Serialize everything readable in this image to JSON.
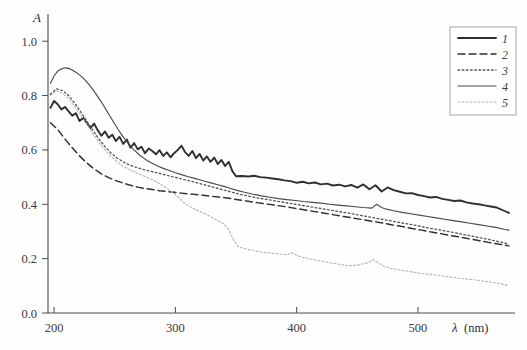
{
  "chart_data": {
    "type": "line",
    "title": "",
    "xlabel": "λ (nm)",
    "xlabel_symbol": "λ",
    "xlabel_unit": "(nm)",
    "ylabel": "A",
    "xlim": [
      195,
      580
    ],
    "ylim": [
      0.0,
      1.1
    ],
    "xticks": [
      200,
      300,
      400,
      500
    ],
    "xtick_labels": [
      "200",
      "300",
      "400",
      "500"
    ],
    "yticks": [
      0.0,
      0.2,
      0.4,
      0.6,
      0.8,
      1.0
    ],
    "ytick_labels": [
      "0.0",
      "0.2",
      "0.4",
      "0.6",
      "0.8",
      "1.0"
    ],
    "grid": false,
    "legend_position": "top-right",
    "legend_entries": [
      "1",
      "2",
      "3",
      "4",
      "5"
    ],
    "series": [
      {
        "name": "1",
        "label": "1",
        "style": "solid-thick",
        "color": "#2f2f2f",
        "width": 1.9,
        "dash": "",
        "x": [
          197,
          200,
          203,
          206,
          209,
          212,
          215,
          218,
          221,
          224,
          227,
          230,
          233,
          236,
          239,
          242,
          245,
          248,
          251,
          254,
          257,
          260,
          263,
          266,
          269,
          272,
          275,
          278,
          281,
          284,
          287,
          290,
          293,
          296,
          299,
          302,
          305,
          308,
          311,
          314,
          317,
          320,
          323,
          326,
          329,
          332,
          335,
          338,
          341,
          344,
          347,
          350,
          355,
          360,
          365,
          370,
          375,
          380,
          385,
          390,
          395,
          400,
          405,
          410,
          415,
          420,
          425,
          430,
          435,
          440,
          445,
          450,
          455,
          460,
          465,
          470,
          475,
          480,
          485,
          490,
          495,
          500,
          505,
          510,
          515,
          520,
          525,
          530,
          535,
          540,
          545,
          550,
          555,
          560,
          565,
          570,
          575
        ],
        "y": [
          0.755,
          0.78,
          0.768,
          0.749,
          0.758,
          0.742,
          0.726,
          0.735,
          0.706,
          0.718,
          0.698,
          0.681,
          0.697,
          0.672,
          0.652,
          0.668,
          0.645,
          0.656,
          0.633,
          0.648,
          0.622,
          0.638,
          0.608,
          0.625,
          0.602,
          0.612,
          0.588,
          0.605,
          0.596,
          0.584,
          0.599,
          0.578,
          0.591,
          0.573,
          0.588,
          0.6,
          0.615,
          0.592,
          0.578,
          0.596,
          0.57,
          0.585,
          0.561,
          0.576,
          0.556,
          0.572,
          0.548,
          0.563,
          0.541,
          0.556,
          0.522,
          0.503,
          0.504,
          0.502,
          0.505,
          0.5,
          0.498,
          0.495,
          0.492,
          0.488,
          0.485,
          0.479,
          0.483,
          0.477,
          0.48,
          0.473,
          0.476,
          0.469,
          0.472,
          0.466,
          0.471,
          0.461,
          0.473,
          0.455,
          0.47,
          0.447,
          0.462,
          0.452,
          0.446,
          0.44,
          0.441,
          0.434,
          0.43,
          0.425,
          0.427,
          0.42,
          0.416,
          0.412,
          0.414,
          0.407,
          0.403,
          0.4,
          0.396,
          0.392,
          0.388,
          0.378,
          0.368
        ]
      },
      {
        "name": "2",
        "label": "2",
        "style": "dashed",
        "color": "#2f2f2f",
        "width": 1.45,
        "dash": "7,4",
        "x": [
          197,
          203,
          209,
          215,
          221,
          227,
          233,
          239,
          245,
          251,
          257,
          263,
          269,
          275,
          281,
          287,
          293,
          299,
          305,
          311,
          317,
          323,
          329,
          335,
          341,
          347,
          353,
          360,
          367,
          375,
          383,
          391,
          399,
          407,
          415,
          423,
          431,
          439,
          447,
          455,
          463,
          471,
          479,
          487,
          495,
          503,
          511,
          519,
          527,
          535,
          543,
          551,
          559,
          567,
          575
        ],
        "y": [
          0.7,
          0.675,
          0.64,
          0.608,
          0.578,
          0.552,
          0.53,
          0.512,
          0.498,
          0.487,
          0.478,
          0.47,
          0.463,
          0.458,
          0.454,
          0.45,
          0.447,
          0.444,
          0.441,
          0.438,
          0.436,
          0.433,
          0.43,
          0.427,
          0.424,
          0.42,
          0.416,
          0.411,
          0.406,
          0.401,
          0.396,
          0.391,
          0.385,
          0.379,
          0.373,
          0.367,
          0.361,
          0.355,
          0.349,
          0.343,
          0.337,
          0.331,
          0.324,
          0.318,
          0.311,
          0.305,
          0.298,
          0.292,
          0.285,
          0.279,
          0.272,
          0.266,
          0.259,
          0.253,
          0.247
        ]
      },
      {
        "name": "3",
        "label": "3",
        "style": "dotted",
        "color": "#555555",
        "width": 1.35,
        "dash": "1.6,2.6",
        "x": [
          197,
          202,
          207,
          212,
          217,
          222,
          227,
          232,
          237,
          242,
          247,
          252,
          257,
          262,
          267,
          272,
          277,
          282,
          287,
          292,
          297,
          302,
          307,
          312,
          317,
          322,
          327,
          332,
          337,
          342,
          347,
          353,
          360,
          367,
          375,
          383,
          391,
          399,
          407,
          415,
          423,
          431,
          439,
          447,
          455,
          463,
          471,
          479,
          487,
          495,
          503,
          511,
          519,
          527,
          535,
          543,
          551,
          559,
          567,
          575
        ],
        "y": [
          0.805,
          0.825,
          0.818,
          0.8,
          0.772,
          0.74,
          0.706,
          0.672,
          0.64,
          0.612,
          0.588,
          0.57,
          0.556,
          0.545,
          0.537,
          0.53,
          0.524,
          0.519,
          0.514,
          0.508,
          0.502,
          0.497,
          0.491,
          0.486,
          0.48,
          0.474,
          0.468,
          0.462,
          0.456,
          0.45,
          0.444,
          0.437,
          0.43,
          0.424,
          0.418,
          0.412,
          0.406,
          0.4,
          0.394,
          0.388,
          0.382,
          0.376,
          0.37,
          0.364,
          0.357,
          0.351,
          0.344,
          0.338,
          0.331,
          0.325,
          0.318,
          0.311,
          0.305,
          0.298,
          0.291,
          0.284,
          0.277,
          0.27,
          0.262,
          0.254
        ]
      },
      {
        "name": "4",
        "label": "4",
        "style": "solid-thin",
        "color": "#4a4a4a",
        "width": 1.15,
        "dash": "",
        "x": [
          197,
          200,
          203,
          206,
          209,
          212,
          215,
          218,
          221,
          224,
          227,
          230,
          233,
          236,
          239,
          242,
          245,
          248,
          251,
          254,
          257,
          260,
          265,
          270,
          275,
          280,
          285,
          290,
          295,
          300,
          305,
          310,
          315,
          320,
          325,
          330,
          335,
          340,
          345,
          350,
          357,
          364,
          371,
          378,
          385,
          392,
          399,
          406,
          413,
          420,
          427,
          434,
          441,
          448,
          455,
          462,
          466,
          470,
          474,
          480,
          487,
          494,
          501,
          508,
          515,
          522,
          529,
          536,
          543,
          550,
          557,
          564,
          571,
          575
        ],
        "y": [
          0.845,
          0.872,
          0.89,
          0.898,
          0.902,
          0.9,
          0.894,
          0.886,
          0.876,
          0.864,
          0.85,
          0.834,
          0.816,
          0.796,
          0.776,
          0.754,
          0.732,
          0.71,
          0.688,
          0.667,
          0.648,
          0.63,
          0.604,
          0.583,
          0.566,
          0.553,
          0.542,
          0.532,
          0.524,
          0.516,
          0.509,
          0.502,
          0.496,
          0.49,
          0.484,
          0.478,
          0.472,
          0.466,
          0.459,
          0.452,
          0.444,
          0.437,
          0.431,
          0.426,
          0.421,
          0.417,
          0.414,
          0.41,
          0.407,
          0.404,
          0.4,
          0.397,
          0.394,
          0.391,
          0.388,
          0.386,
          0.4,
          0.388,
          0.382,
          0.376,
          0.37,
          0.365,
          0.36,
          0.355,
          0.35,
          0.345,
          0.34,
          0.335,
          0.33,
          0.325,
          0.32,
          0.315,
          0.308,
          0.305
        ]
      },
      {
        "name": "5",
        "label": "5",
        "style": "dotted-light",
        "color": "#b4b4b4",
        "width": 1.1,
        "dash": "2,2",
        "x": [
          197,
          202,
          207,
          212,
          217,
          222,
          227,
          232,
          237,
          242,
          247,
          252,
          257,
          262,
          267,
          272,
          277,
          282,
          287,
          292,
          297,
          300,
          303,
          306,
          309,
          312,
          315,
          318,
          321,
          325,
          330,
          335,
          340,
          344,
          348,
          352,
          356,
          362,
          368,
          374,
          380,
          386,
          392,
          396,
          400,
          404,
          410,
          418,
          426,
          434,
          442,
          450,
          458,
          463,
          468,
          472,
          478,
          486,
          494,
          502,
          510,
          518,
          526,
          534,
          542,
          550,
          558,
          566,
          575
        ],
        "y": [
          0.8,
          0.818,
          0.808,
          0.788,
          0.76,
          0.728,
          0.694,
          0.66,
          0.628,
          0.6,
          0.576,
          0.556,
          0.54,
          0.528,
          0.518,
          0.508,
          0.498,
          0.488,
          0.476,
          0.462,
          0.446,
          0.436,
          0.424,
          0.41,
          0.4,
          0.392,
          0.384,
          0.378,
          0.372,
          0.364,
          0.352,
          0.34,
          0.328,
          0.306,
          0.268,
          0.244,
          0.238,
          0.232,
          0.226,
          0.222,
          0.22,
          0.217,
          0.214,
          0.222,
          0.212,
          0.206,
          0.2,
          0.192,
          0.186,
          0.18,
          0.174,
          0.176,
          0.184,
          0.196,
          0.182,
          0.172,
          0.164,
          0.158,
          0.152,
          0.146,
          0.142,
          0.138,
          0.133,
          0.128,
          0.124,
          0.12,
          0.115,
          0.11,
          0.1
        ]
      }
    ]
  },
  "legend": {
    "entries": [
      {
        "label": "1"
      },
      {
        "label": "2"
      },
      {
        "label": "3"
      },
      {
        "label": "4"
      },
      {
        "label": "5"
      }
    ]
  },
  "axes": {
    "y_title": "A",
    "x_symbol": "λ",
    "x_unit": "(nm)"
  }
}
